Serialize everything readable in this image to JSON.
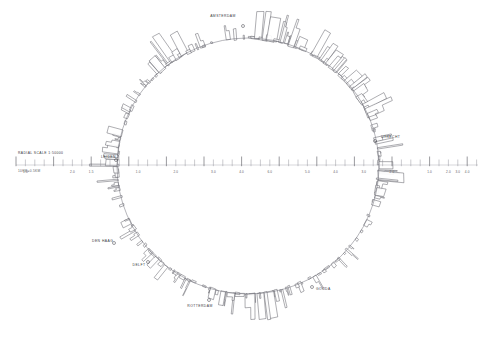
{
  "figure": {
    "background_color": "#ffffff",
    "stroke_color": "#4a4a52",
    "baseline_color": "#6d6d76",
    "label_color": "#3a3a42"
  },
  "scale_legend": {
    "caption": "RADIAL SCALE 1:50000",
    "subcaption": "10KM=0.5KM",
    "caption_x": 18,
    "caption_y": 154,
    "subcaption_x": 18,
    "subcaption_y": 172
  },
  "ruler": {
    "axis_y": 165,
    "x_start": 16,
    "x_end": 478,
    "minor_tick_height": 5.5,
    "major_tick_height": 8.5,
    "label_y": 173,
    "tick_spacing": 9.4,
    "tick_count": 50,
    "major_every": 4,
    "labels": [
      {
        "text": "1.0",
        "x": 25.4
      },
      {
        "text": "2.0",
        "x": 72.4
      },
      {
        "text": "1.5",
        "x": 91.2
      },
      {
        "text": "1.0",
        "x": 138.2
      },
      {
        "text": "2.0",
        "x": 175.8
      },
      {
        "text": "3.0",
        "x": 213.4
      },
      {
        "text": "4.0",
        "x": 241.6
      },
      {
        "text": "6.0",
        "x": 269.8
      },
      {
        "text": "5.0",
        "x": 307.4
      },
      {
        "text": "4.0",
        "x": 335.6
      },
      {
        "text": "3.0",
        "x": 363.8
      },
      {
        "text": "2.0",
        "x": 392.0
      },
      {
        "text": "1.0",
        "x": 429.6
      },
      {
        "text": "2.0",
        "x": 448.4
      },
      {
        "text": "3.0",
        "x": 457.8
      },
      {
        "text": "4.0",
        "x": 467.2
      }
    ]
  },
  "cities": [
    {
      "name": "AMSTERDAM",
      "label_x": 223,
      "label_y": 17,
      "dot_x": 243,
      "dot_y": 26,
      "anchor": "middle"
    },
    {
      "name": "UTRECHT",
      "label_x": 381,
      "label_y": 138,
      "dot_x": 375,
      "dot_y": 141,
      "anchor": "start"
    },
    {
      "name": "GOUDA",
      "label_x": 316,
      "label_y": 290,
      "dot_x": 312,
      "dot_y": 287,
      "anchor": "start"
    },
    {
      "name": "ROTTERDAM",
      "label_x": 200,
      "label_y": 307,
      "dot_x": 209,
      "dot_y": 300,
      "anchor": "middle"
    },
    {
      "name": "DELFT",
      "label_x": 139,
      "label_y": 266,
      "dot_x": 148,
      "dot_y": 262,
      "anchor": "middle"
    },
    {
      "name": "DEN HAAG",
      "label_x": 92,
      "label_y": 242,
      "dot_x": 114,
      "dot_y": 243,
      "anchor": "start"
    },
    {
      "name": "LEIDEN",
      "label_x": 101,
      "label_y": 158,
      "dot_x": 116,
      "dot_y": 160,
      "anchor": "start"
    }
  ],
  "geometry": {
    "center_x": 248,
    "center_y": 166,
    "radius_x": 131,
    "radius_y": 128,
    "block_count": 236,
    "random_seed": 20250411,
    "min_depth": 1.5,
    "max_depth": 26,
    "min_width": 1.0,
    "max_width": 9.0
  },
  "chart_data": {
    "type": "line",
    "xlabel": "",
    "ylabel": "",
    "legend_position": "left",
    "grid": false,
    "categories": [
      "AMSTERDAM",
      "UTRECHT",
      "GOUDA",
      "ROTTERDAM",
      "DELFT",
      "DEN HAAG",
      "LEIDEN"
    ],
    "values": [
      26,
      22,
      24,
      19,
      14,
      17,
      12
    ],
    "axis_tick_labels": [
      "1.0",
      "2.0",
      "1.5",
      "1.0",
      "2.0",
      "3.0",
      "4.0",
      "6.0",
      "5.0",
      "4.0",
      "3.0",
      "2.0",
      "1.0",
      "2.0",
      "3.0",
      "4.0"
    ],
    "axis_range": [
      0,
      45
    ]
  }
}
